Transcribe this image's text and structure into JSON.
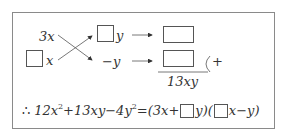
{
  "diagram": {
    "left_top_term": "3x",
    "left_bottom_var": "x",
    "right_top_var": "y",
    "right_bottom_term": "−y",
    "sum_label": "13xy",
    "plus_sign": "+"
  },
  "conclusion": {
    "therefore": "∴",
    "lhs": "12x² + 13xy − 4y²",
    "lhs_parts": [
      "12x",
      "2",
      "+13xy−4y",
      "2",
      "="
    ],
    "rhs_factor1_prefix": "(3x+",
    "rhs_factor1_suffix": "y)(",
    "rhs_factor2_suffix": "x−y)"
  }
}
